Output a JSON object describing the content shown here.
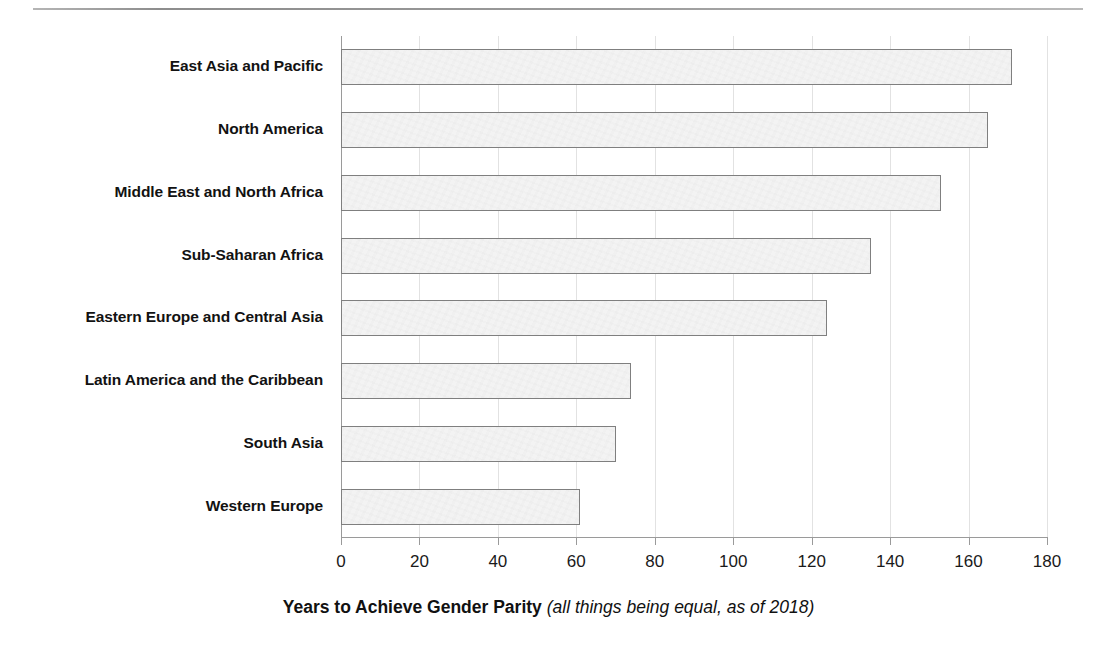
{
  "chart_data": {
    "type": "bar",
    "orientation": "horizontal",
    "title": "",
    "xlabel": "Years to Achieve Gender Parity (all things being equal, as of 2018)",
    "xlabel_main": "Years to Achieve Gender Parity",
    "xlabel_note": "(all things being equal, as of 2018)",
    "ylabel": "",
    "categories": [
      "East Asia and Pacific",
      "North America",
      "Middle East and North Africa",
      "Sub-Saharan Africa",
      "Eastern Europe and Central Asia",
      "Latin America and the Caribbean",
      "South Asia",
      "Western Europe"
    ],
    "values": [
      171,
      165,
      153,
      135,
      124,
      74,
      70,
      61
    ],
    "xlim": [
      0,
      180
    ],
    "xticks": [
      0,
      20,
      40,
      60,
      80,
      100,
      120,
      140,
      160,
      180
    ],
    "xtick_labels": [
      "0",
      "20",
      "40",
      "60",
      "80",
      "100",
      "120",
      "140",
      "160",
      "180"
    ],
    "grid": "vertical",
    "legend": "none",
    "bar_fill": "#f3f3f3",
    "bar_border": "#7f7f7f",
    "grid_color": "#e2e2e2",
    "axis_color": "#9a9a9a",
    "text_color": "#121212"
  }
}
